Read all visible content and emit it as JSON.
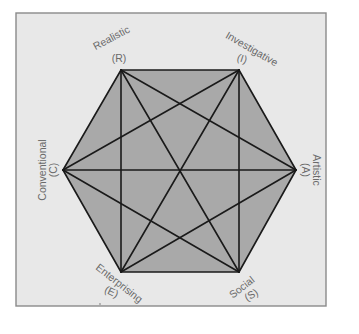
{
  "diagram": {
    "colors": {
      "background": "#ffffff",
      "panel": "#e8e8e8",
      "panel_border": "#8a8a8a",
      "hexagon_fill": "#a9a9a9",
      "lines": "#1a1a1a",
      "label_text": "#6a6a6a"
    },
    "types": [
      {
        "id": "R",
        "name": "Realistic",
        "code": "(R)"
      },
      {
        "id": "I",
        "name": "Investigative",
        "code": "(I)"
      },
      {
        "id": "A",
        "name": "Artistic",
        "code": "(A)"
      },
      {
        "id": "S",
        "name": "Social",
        "code": "(S)"
      },
      {
        "id": "E",
        "name": "Enterprising",
        "code": "(E)"
      },
      {
        "id": "C",
        "name": "Conventional",
        "code": "(C)"
      }
    ],
    "connections": [
      [
        "R",
        "I"
      ],
      [
        "I",
        "A"
      ],
      [
        "A",
        "S"
      ],
      [
        "S",
        "E"
      ],
      [
        "E",
        "C"
      ],
      [
        "C",
        "R"
      ],
      [
        "R",
        "A"
      ],
      [
        "R",
        "S"
      ],
      [
        "R",
        "E"
      ],
      [
        "I",
        "S"
      ],
      [
        "I",
        "E"
      ],
      [
        "I",
        "C"
      ],
      [
        "A",
        "E"
      ],
      [
        "A",
        "C"
      ],
      [
        "S",
        "C"
      ]
    ]
  }
}
